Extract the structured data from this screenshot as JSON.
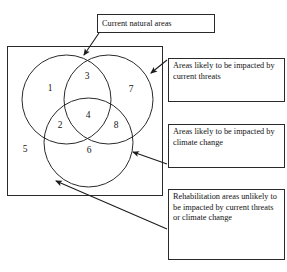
{
  "diagram": {
    "type": "venn-3-circle-with-universe",
    "universe_label_implicit": "Current natural areas",
    "regions": [
      {
        "id": "region-1",
        "label": "1",
        "meaning": "current threats only",
        "x": 50,
        "y": 91
      },
      {
        "id": "region-3",
        "label": "3",
        "meaning": "current threats and climate change",
        "x": 87,
        "y": 79
      },
      {
        "id": "region-7",
        "label": "7",
        "meaning": "climate change only",
        "x": 131,
        "y": 92
      },
      {
        "id": "region-2",
        "label": "2",
        "meaning": "current threats and rehabilitation",
        "x": 60,
        "y": 128
      },
      {
        "id": "region-4",
        "label": "4",
        "meaning": "all three",
        "x": 88,
        "y": 118
      },
      {
        "id": "region-8",
        "label": "8",
        "meaning": "climate change and rehabilitation",
        "x": 116,
        "y": 128
      },
      {
        "id": "region-6",
        "label": "6",
        "meaning": "rehabilitation only",
        "x": 89,
        "y": 153
      },
      {
        "id": "region-5",
        "label": "5",
        "meaning": "outside all circles",
        "x": 25,
        "y": 152
      }
    ],
    "circles": [
      {
        "id": "circle-current-threats",
        "cx": 66.5,
        "cy": 99.5,
        "r": 44.5
      },
      {
        "id": "circle-climate-change",
        "cx": 108.5,
        "cy": 99.5,
        "r": 44.5
      },
      {
        "id": "circle-rehabilitation",
        "cx": 88.5,
        "cy": 142.5,
        "r": 44.5
      }
    ],
    "universe_rect": {
      "x": 7,
      "y": 46,
      "width": 156,
      "height": 150
    }
  },
  "callouts": {
    "title": {
      "name": "current-natural-areas",
      "text": "Current natural areas",
      "points_to": "universe-rectangle"
    },
    "threats": {
      "name": "current-threats",
      "text": "Areas likely to be impacted by current threats",
      "points_to": "circle-climate-change-edge"
    },
    "climate": {
      "name": "climate-change",
      "text": "Areas likely to be impacted by climate change",
      "points_to": "circle-rehabilitation-edge"
    },
    "rehabilitation": {
      "name": "rehabilitation-areas",
      "text": "Rehabilitation areas unlikely to be impacted by current threats or climate change",
      "points_to": "universe-rectangle-lower-left"
    }
  },
  "colors": {
    "stroke": "#2a2a2a",
    "text": "#121212",
    "background": "#ffffff"
  }
}
